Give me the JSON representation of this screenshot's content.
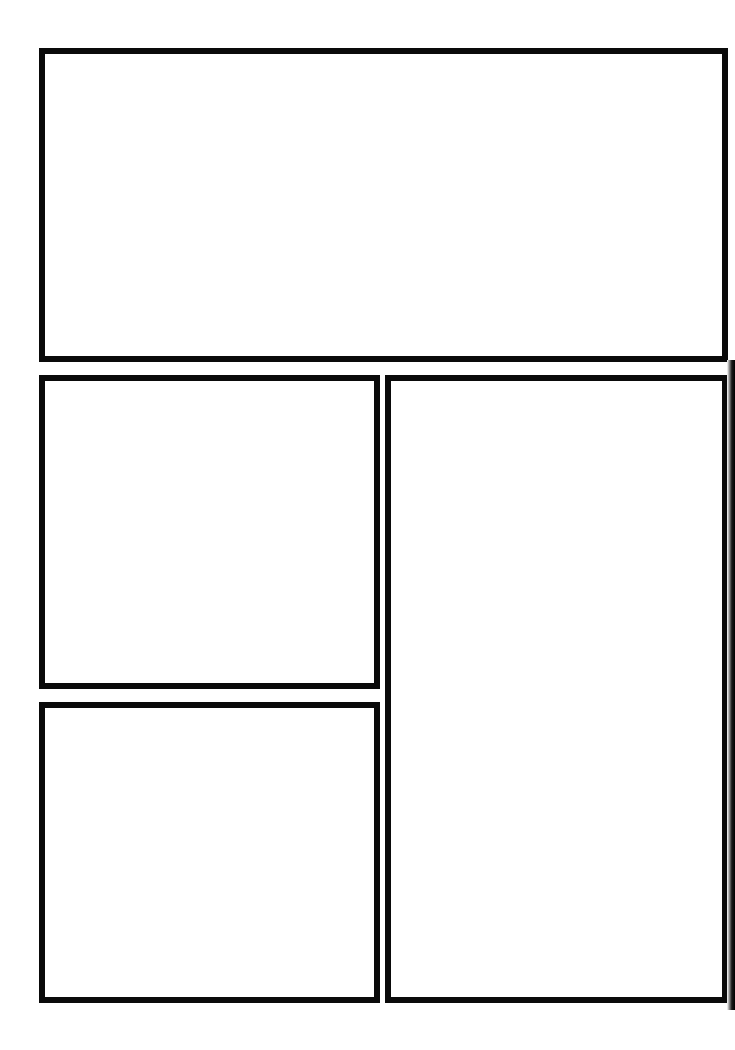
{
  "page": {
    "type": "comic-page-template",
    "background": "#ffffff",
    "border_color": "#0a0a0a",
    "panels": [
      {
        "id": "top-wide",
        "x": 39,
        "y": 48,
        "w": 689,
        "h": 314,
        "content": ""
      },
      {
        "id": "middle-left",
        "x": 39,
        "y": 375,
        "w": 341,
        "h": 314,
        "content": ""
      },
      {
        "id": "bottom-left",
        "x": 39,
        "y": 702,
        "w": 341,
        "h": 301,
        "content": ""
      },
      {
        "id": "right-tall",
        "x": 385,
        "y": 375,
        "w": 343,
        "h": 628,
        "content": ""
      }
    ]
  }
}
